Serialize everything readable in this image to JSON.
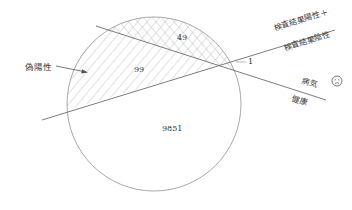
{
  "diagram": {
    "counts": {
      "true_positive": "49",
      "false_positive": "99",
      "false_negative": "1",
      "true_negative": "9851"
    },
    "labels": {
      "false_positive": "偽陽性",
      "test_positive": "検査結果陽性＋",
      "test_negative": "検査結果陰性",
      "disease": "病気",
      "healthy": "健康"
    },
    "icons": {
      "disease_face": "sad-face-icon"
    },
    "colors": {
      "line": "#6e6e6e",
      "circle": "#a8a8a8",
      "hatch": "#b5b5b5",
      "text": "#3a3a3a"
    }
  }
}
